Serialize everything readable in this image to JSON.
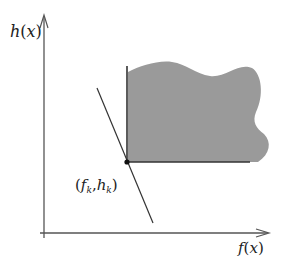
{
  "diagram": {
    "y_axis_label": {
      "fn": "h",
      "open": "(",
      "var": "x",
      "close": ")"
    },
    "x_axis_label": {
      "fn": "f",
      "open": "(",
      "var": "x",
      "close": ")"
    },
    "point_label": {
      "open": "(",
      "f": "f",
      "f_sub": "k",
      "comma": ",",
      "h": "h",
      "h_sub": "k",
      "close": ")"
    },
    "colors": {
      "axis": "#555555",
      "region_fill": "#9a9a9a",
      "line": "#333333",
      "point": "#111111"
    }
  }
}
